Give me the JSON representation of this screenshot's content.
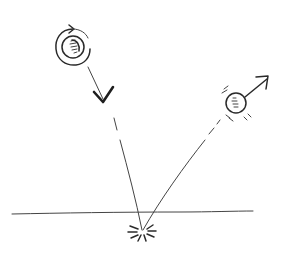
{
  "diagram": {
    "colors": {
      "ink": "#2a2a2a",
      "background": "#ffffff"
    },
    "elements": {
      "incoming_ball": {
        "cx": 72,
        "cy": 47,
        "r": 10,
        "spin": "clockwise-spiral"
      },
      "incoming_arrow_head": {
        "x": 103,
        "y": 100
      },
      "ground_line": {
        "x1": 12,
        "y1": 213,
        "x2": 253,
        "y2": 211
      },
      "impact_point": {
        "x": 143,
        "y": 232
      },
      "outgoing_ball": {
        "cx": 236,
        "cy": 103,
        "r": 10
      },
      "outgoing_arrow_head": {
        "x": 268,
        "y": 77
      }
    }
  }
}
